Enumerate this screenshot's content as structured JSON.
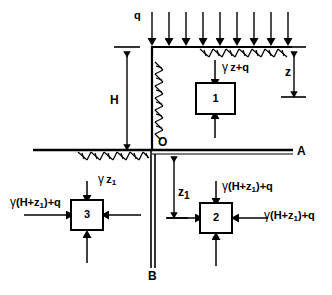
{
  "figure": {
    "ink_color": "#000000",
    "background_color": "#ffffff"
  },
  "labels": {
    "surcharge": "q",
    "vertical_stress_element1": "γ z+q",
    "depth_z": "z",
    "wall_height_H": "H",
    "depth_z1": "z₁",
    "point_O": "O",
    "point_A": "A",
    "point_B": "B",
    "element3_top": "γ z₁",
    "element3_left": "γ (H+z₁)+q",
    "element2_top": "γ (H+z₁)+q",
    "element2_right": "γ (H+z₁)+q"
  },
  "elements": [
    {
      "id": "1",
      "label": "1"
    },
    {
      "id": "2",
      "label": "2"
    },
    {
      "id": "3",
      "label": "3"
    }
  ],
  "surcharge_arrows": {
    "count": 9,
    "direction": "down"
  },
  "hatching": {
    "top_surface": true,
    "wall_face": true,
    "lower_surface": true
  }
}
